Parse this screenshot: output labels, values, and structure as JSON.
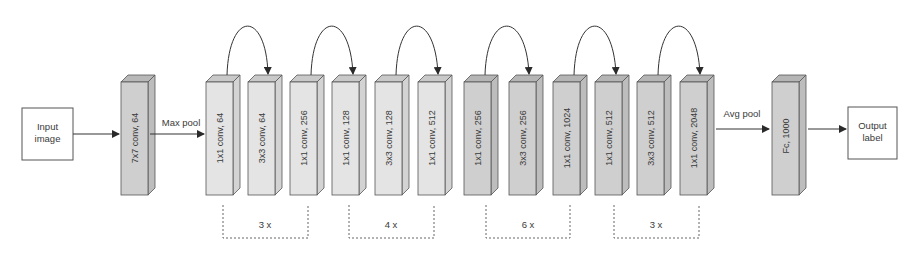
{
  "diagram": {
    "input_box": {
      "line1": "Input",
      "line2": "image"
    },
    "output_box": {
      "line1": "Output",
      "line2": "label"
    },
    "stem": {
      "label": "7x7 conv, 64"
    },
    "max_pool_label": "Max pool",
    "avg_pool_label": "Avg pool",
    "fc": {
      "label": "Fc, 1000"
    },
    "colors": {
      "light_face": "#e4e4e4",
      "light_top": "#c9c9c9",
      "light_side": "#d3d3d3",
      "dark_face": "#cfcfcf",
      "dark_top": "#b5b5b5",
      "dark_side": "#bdbdbd",
      "stroke": "#4a4a4a"
    },
    "blocks": [
      {
        "label": "1x1 conv, 64",
        "tone": "light"
      },
      {
        "label": "3x3 conv, 64",
        "tone": "light"
      },
      {
        "label": "1x1 conv, 256",
        "tone": "light"
      },
      {
        "label": "1x1 conv, 128",
        "tone": "light"
      },
      {
        "label": "3x3 conv, 128",
        "tone": "light"
      },
      {
        "label": "1x1 conv, 512",
        "tone": "light"
      },
      {
        "label": "1x1 conv, 256",
        "tone": "dark"
      },
      {
        "label": "3x3 conv, 256",
        "tone": "dark"
      },
      {
        "label": "1x1 conv, 1024",
        "tone": "dark"
      },
      {
        "label": "1x1 conv, 512",
        "tone": "dark"
      },
      {
        "label": "3x3 conv, 512",
        "tone": "dark"
      },
      {
        "label": "1x1 conv, 2048",
        "tone": "dark"
      }
    ],
    "repeats": [
      {
        "label": "3 x"
      },
      {
        "label": "4 x"
      },
      {
        "label": "6 x"
      },
      {
        "label": "3 x"
      }
    ]
  }
}
